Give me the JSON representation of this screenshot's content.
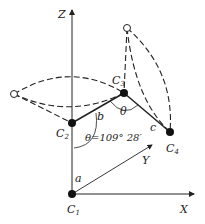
{
  "axes": {
    "z": "Z",
    "x": "X",
    "y": "Y"
  },
  "atoms": [
    {
      "id": "C1",
      "label": "C",
      "sub": "1",
      "x": 72,
      "y": 194
    },
    {
      "id": "C2",
      "label": "C",
      "sub": "2",
      "x": 72,
      "y": 123
    },
    {
      "id": "C3",
      "label": "C",
      "sub": "3",
      "x": 124,
      "y": 93
    },
    {
      "id": "C4",
      "label": "C",
      "sub": "4",
      "x": 170,
      "y": 132
    }
  ],
  "bonds": {
    "a": "a",
    "b": "b",
    "c": "c"
  },
  "angles": {
    "theta": "θ",
    "tetrahedral": "θ=109° 28′"
  }
}
